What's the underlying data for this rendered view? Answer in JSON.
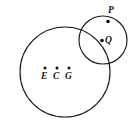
{
  "figure": {
    "type": "geometry-diagram",
    "background_color": "#ffffff",
    "stroke_color": "#1a1a1a",
    "point_color": "#111111",
    "width": 134,
    "height": 135,
    "shapes": [
      {
        "name": "large-circle",
        "kind": "circle",
        "cx": 65,
        "cy": 72,
        "r": 45
      },
      {
        "name": "small-circle",
        "kind": "circle",
        "cx": 103,
        "cy": 40,
        "r": 24
      }
    ],
    "points": [
      {
        "id": "P",
        "label": "P",
        "x": 108,
        "y": 21.5,
        "on": "small-circle"
      },
      {
        "id": "Q",
        "label": "Q",
        "x": 102,
        "y": 40.5,
        "on": "small-circle-interior"
      },
      {
        "id": "E",
        "label": "E",
        "x": 45,
        "y": 68,
        "on": "large-circle-interior"
      },
      {
        "id": "C",
        "label": "C",
        "x": 57,
        "y": 68,
        "on": "large-circle-interior"
      },
      {
        "id": "G",
        "label": "G",
        "x": 69,
        "y": 68,
        "on": "large-circle-interior"
      }
    ]
  },
  "labels": {
    "P": "P",
    "Q": "Q",
    "E": "E",
    "C": "C",
    "G": "G"
  }
}
